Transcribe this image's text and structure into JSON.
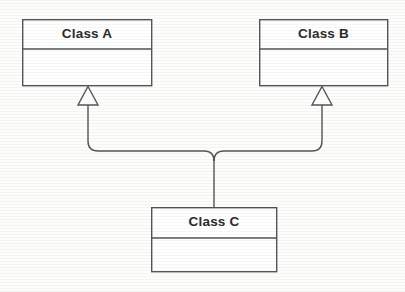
{
  "diagram": {
    "kind": "uml-class-diagram",
    "relationship": "generalization",
    "canvas": {
      "width": 405,
      "height": 292,
      "background": "#fdfdfc"
    },
    "style": {
      "line_color": "#555555",
      "line_width": 1.4,
      "text_color": "#2b2b2b",
      "box_fill": "#ffffff",
      "arrowhead_fill": "#ffffff",
      "corner_radius": 10
    },
    "classes": [
      {
        "id": "class-a",
        "name": "Class A",
        "role": "superclass",
        "box": {
          "x": 22,
          "y": 19,
          "width": 130,
          "height": 67
        },
        "name_divider_y": 49,
        "compartments": [
          "name",
          "attributes"
        ]
      },
      {
        "id": "class-b",
        "name": "Class B",
        "role": "superclass",
        "box": {
          "x": 259,
          "y": 19,
          "width": 129,
          "height": 67
        },
        "name_divider_y": 49,
        "compartments": [
          "name",
          "attributes"
        ]
      },
      {
        "id": "class-c",
        "name": "Class C",
        "role": "subclass",
        "box": {
          "x": 151,
          "y": 207,
          "width": 126,
          "height": 65
        },
        "name_divider_y": 238,
        "compartments": [
          "name",
          "attributes"
        ]
      }
    ],
    "generalizations": [
      {
        "id": "gen-c-to-a",
        "from": "class-c",
        "to": "class-a",
        "arrowhead": "hollow-triangle",
        "arrow_tip": {
          "x": 88,
          "y": 86
        },
        "arrow_base_y": 105,
        "arrow_half_width": 10,
        "trunk_x": 214,
        "elbow_y": 151
      },
      {
        "id": "gen-c-to-b",
        "from": "class-c",
        "to": "class-b",
        "arrowhead": "hollow-triangle",
        "arrow_tip": {
          "x": 322,
          "y": 86
        },
        "arrow_base_y": 105,
        "arrow_half_width": 10,
        "trunk_x": 214,
        "elbow_y": 151
      }
    ],
    "junction": {
      "x": 214,
      "y": 151,
      "drop_to_y": 207
    }
  }
}
